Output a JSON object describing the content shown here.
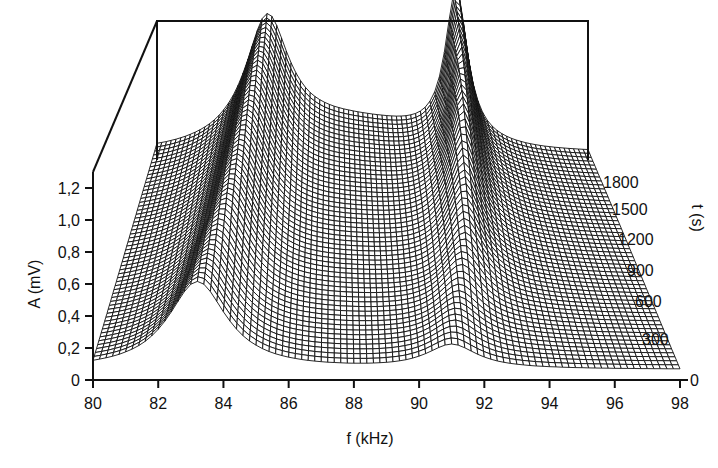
{
  "chart_data": {
    "type": "surface3d",
    "title": "",
    "xlabel": "f (kHz)",
    "ylabel": "A (mV)",
    "zlabel": "t (s)",
    "x_ticks": [
      "80",
      "82",
      "84",
      "86",
      "88",
      "90",
      "92",
      "94",
      "96",
      "98"
    ],
    "y_ticks": [
      "0",
      "0,2",
      "0,4",
      "0,6",
      "0,8",
      "1,0",
      "1,2"
    ],
    "z_ticks": [
      "0",
      "300",
      "600",
      "900",
      "1200",
      "1500",
      "1800"
    ],
    "xlim": [
      80,
      98
    ],
    "ylim": [
      0,
      1.2
    ],
    "zlim": [
      0,
      1800
    ],
    "grid": false,
    "legend": null,
    "series": [
      {
        "name": "peak_1",
        "t": [
          0,
          300,
          600,
          900,
          1200,
          1500,
          1800
        ],
        "f_center": [
          83.2,
          83.5,
          83.8,
          84.0,
          84.2,
          84.4,
          84.6
        ],
        "amplitude": [
          0.55,
          0.6,
          0.68,
          0.75,
          0.83,
          0.92,
          1.0
        ]
      },
      {
        "name": "peak_2",
        "t": [
          0,
          300,
          600,
          900,
          1200,
          1500,
          1800
        ],
        "f_center": [
          91.0,
          91.4,
          91.8,
          92.0,
          92.2,
          92.4,
          92.5
        ],
        "amplitude": [
          0.15,
          0.25,
          0.4,
          0.6,
          0.85,
          1.05,
          1.25
        ]
      }
    ]
  }
}
